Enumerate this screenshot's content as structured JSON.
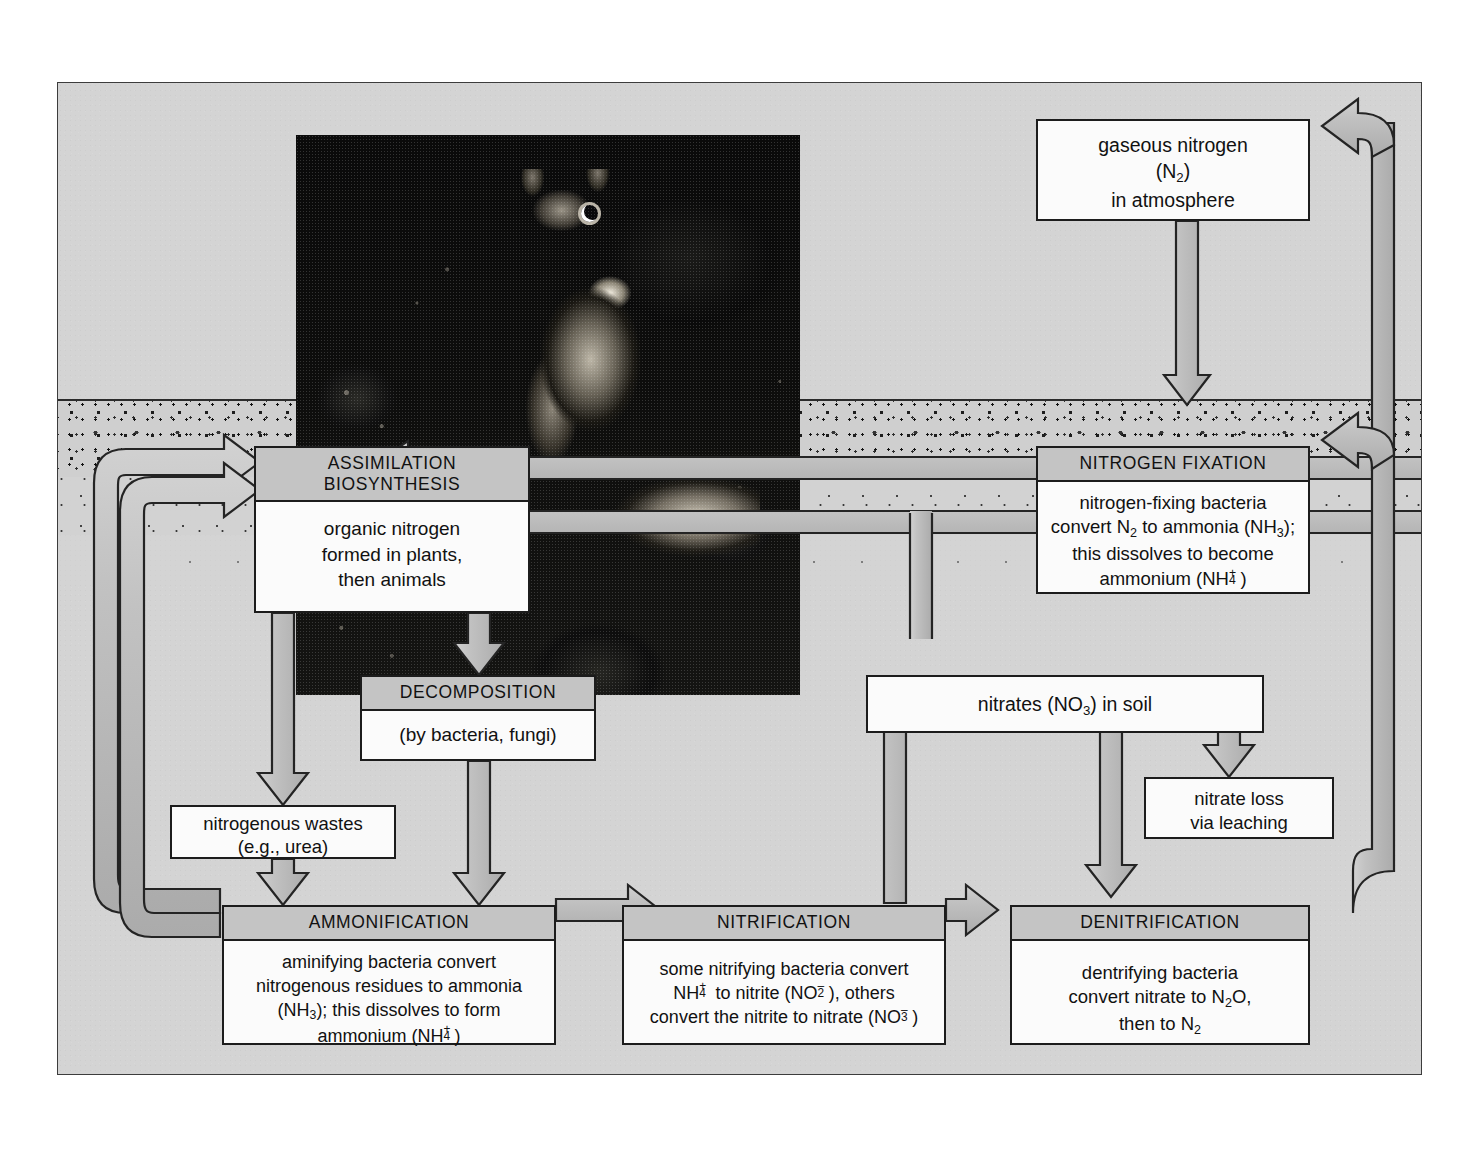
{
  "diagram": {
    "colors": {
      "panel_background": "#d4d4d4",
      "box_fill": "#fbfbfb",
      "box_header_fill": "#c4c4c4",
      "outline": "#1c1c1c",
      "arrow_fill": "#b9b9b9",
      "photo_background": "#0a0a0a"
    },
    "regions": {
      "atmosphere_label": "atmosphere",
      "soil_label": "soil"
    },
    "photo": {
      "name": "squirrel-photograph",
      "subject": "squirrel eating on forest floor with berries"
    },
    "boxes": [
      {
        "id": "gaseous-nitrogen",
        "header": "",
        "lines": [
          "gaseous nitrogen",
          "(N₂)",
          "in atmosphere"
        ],
        "line1": "gaseous nitrogen",
        "line2_pre": "(N",
        "line2_sub": "2",
        "line2_post": ")",
        "line3": "in atmosphere"
      },
      {
        "id": "nitrogen-fixation",
        "header": "NITROGEN FIXATION",
        "line1": "nitrogen-fixing bacteria",
        "line2_a": "convert N",
        "line2_sub1": "2",
        "line2_b": " to ammonia (NH",
        "line2_sub2": "3",
        "line2_c": ");",
        "line3": "this dissolves to become",
        "line4_a": "ammonium (NH",
        "line4_sup": "+",
        "line4_sub": "4",
        "line4_b": ")"
      },
      {
        "id": "assimilation-biosynthesis",
        "header_line1": "ASSIMILATION",
        "header_line2": "BIOSYNTHESIS",
        "line1": "organic nitrogen",
        "line2": "formed in plants,",
        "line3": "then animals"
      },
      {
        "id": "decomposition",
        "header": "DECOMPOSITION",
        "line1": "(by bacteria, fungi)"
      },
      {
        "id": "nitrogenous-wastes",
        "header": "",
        "line1": "nitrogenous wastes",
        "line2": "(e.g., urea)"
      },
      {
        "id": "nitrates-in-soil",
        "header": "",
        "line1_a": "nitrates (NO",
        "line1_sub": "3",
        "line1_b": ") in soil"
      },
      {
        "id": "nitrate-loss",
        "header": "",
        "line1": "nitrate loss",
        "line2": "via leaching"
      },
      {
        "id": "ammonification",
        "header": "AMMONIFICATION",
        "line1": "aminifying bacteria convert",
        "line2": "nitrogenous residues to ammonia",
        "line3_a": "(NH",
        "line3_sub": "3",
        "line3_b": "); this dissolves to form",
        "line4_a": "ammonium (NH",
        "line4_sup": "+",
        "line4_sub": "4",
        "line4_b": ")"
      },
      {
        "id": "nitrification",
        "header": "NITRIFICATION",
        "line1": "some nitrifying bacteria convert",
        "line2_a": "NH",
        "line2_sup": "+",
        "line2_sub": "4",
        "line2_b": " to nitrite (NO",
        "line2_sup2": "–",
        "line2_sub2": "2",
        "line2_c": "), others",
        "line3_a": "convert the nitrite to nitrate (NO",
        "line3_sup": "–",
        "line3_sub": "3",
        "line3_b": ")"
      },
      {
        "id": "denitrification",
        "header": "DENITRIFICATION",
        "line1": "dentrifying bacteria",
        "line2_a": "convert nitrate to N",
        "line2_sub": "2",
        "line2_b": "O,",
        "line3_a": "then to N",
        "line3_sub": "2"
      }
    ],
    "flows": [
      {
        "from": "gaseous-nitrogen",
        "to": "nitrogen-fixation",
        "direction": "down"
      },
      {
        "from": "nitrogen-fixation",
        "to": "assimilation-biosynthesis",
        "direction": "left"
      },
      {
        "from": "nitrogen-fixation",
        "to": "nitrates-in-soil",
        "direction": "left-then-down"
      },
      {
        "from": "assimilation-biosynthesis",
        "to": "decomposition",
        "direction": "down"
      },
      {
        "from": "assimilation-biosynthesis",
        "to": "nitrogenous-wastes",
        "direction": "down-left"
      },
      {
        "from": "decomposition",
        "to": "ammonification",
        "direction": "down"
      },
      {
        "from": "nitrogenous-wastes",
        "to": "ammonification",
        "direction": "down"
      },
      {
        "from": "ammonification",
        "to": "nitrification",
        "direction": "right"
      },
      {
        "from": "nitrification",
        "to": "denitrification",
        "direction": "right"
      },
      {
        "from": "nitrification",
        "to": "nitrates-in-soil",
        "direction": "up"
      },
      {
        "from": "nitrates-in-soil",
        "to": "nitrate-loss",
        "direction": "down"
      },
      {
        "from": "nitrates-in-soil",
        "to": "denitrification",
        "direction": "down"
      },
      {
        "from": "denitrification",
        "to": "gaseous-nitrogen",
        "direction": "right-then-up"
      },
      {
        "from": "denitrification",
        "to": "nitrogen-fixation",
        "direction": "right-then-up"
      },
      {
        "from": "ammonification",
        "to": "assimilation-biosynthesis",
        "direction": "left-then-up"
      }
    ]
  }
}
